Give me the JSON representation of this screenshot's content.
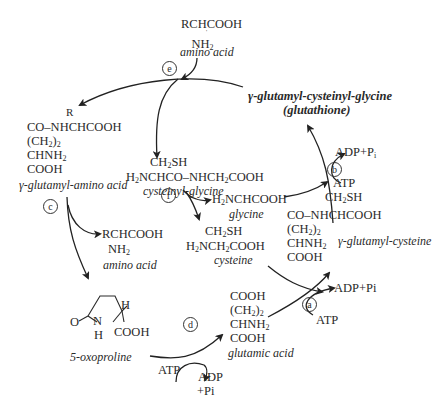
{
  "molecules": {
    "amino_acid_top": {
      "formula": "RCHCOOH",
      "substituent": "NH2",
      "label": "amino acid"
    },
    "glutathione": {
      "label_line1": "γ-glutamyl-cysteinyl-glycine",
      "label_line2": "(glutathione)"
    },
    "gamma_glutamyl_amino_acid": {
      "r_group": "R",
      "lines": [
        "CO–NHCHCOOH",
        "(CH2)2",
        "CHNH2",
        "COOH"
      ],
      "label": "γ-glutamyl-amino acid"
    },
    "cysteinyl_glycine": {
      "line1": "CH2SH",
      "line2": "H2NCHCO–NHCH2COOH",
      "label": "cysteinyl-glycine"
    },
    "glycine": {
      "formula": "H2NCHCOOH",
      "label": "glycine"
    },
    "cysteine": {
      "line1": "CH2SH",
      "line2": "H2NCH2COOH",
      "label": "cysteine"
    },
    "amino_acid_mid": {
      "formula": "RCHCOOH",
      "substituent": "NH2",
      "label": "amino acid"
    },
    "gamma_glutamyl_cysteine": {
      "r_group": "CH2SH",
      "lines": [
        "CO–NHCHCOOH",
        "(CH2)2",
        "CHNH2",
        "COOH"
      ],
      "label": "γ-glutamyl-cysteine"
    },
    "oxoproline": {
      "ring_o": "O",
      "ring_n": "N",
      "ring_h_n": "H",
      "ring_h": "H",
      "cooh": "COOH",
      "label": "5-oxoproline"
    },
    "glutamic_acid": {
      "lines": [
        "COOH",
        "(CH2)2",
        "CHNH2",
        "COOH"
      ],
      "label": "glutamic acid"
    }
  },
  "steps": [
    {
      "id": "a",
      "label": "a",
      "inputs": [
        "ATP"
      ],
      "outputs": [
        "ADP+Pi"
      ]
    },
    {
      "id": "b",
      "label": "b",
      "inputs": [
        "ATP"
      ],
      "outputs": [
        "ADP+Pi"
      ]
    },
    {
      "id": "c",
      "label": "c"
    },
    {
      "id": "d",
      "label": "d",
      "inputs": [
        "ATP"
      ],
      "outputs": [
        "ADP",
        "+Pi"
      ]
    },
    {
      "id": "e",
      "label": "e"
    },
    {
      "id": "f",
      "label": "f"
    }
  ],
  "cofactors": {
    "b_out": "ADP+Pi",
    "b_in": "ATP",
    "a_out": "ADP+Pi",
    "a_in": "ATP",
    "d_in": "ATP",
    "d_out1": "ADP",
    "d_out2": "+Pi"
  },
  "colors": {
    "ink": "#2a2a2a",
    "background": "#ffffff",
    "arrow": "#222222"
  }
}
